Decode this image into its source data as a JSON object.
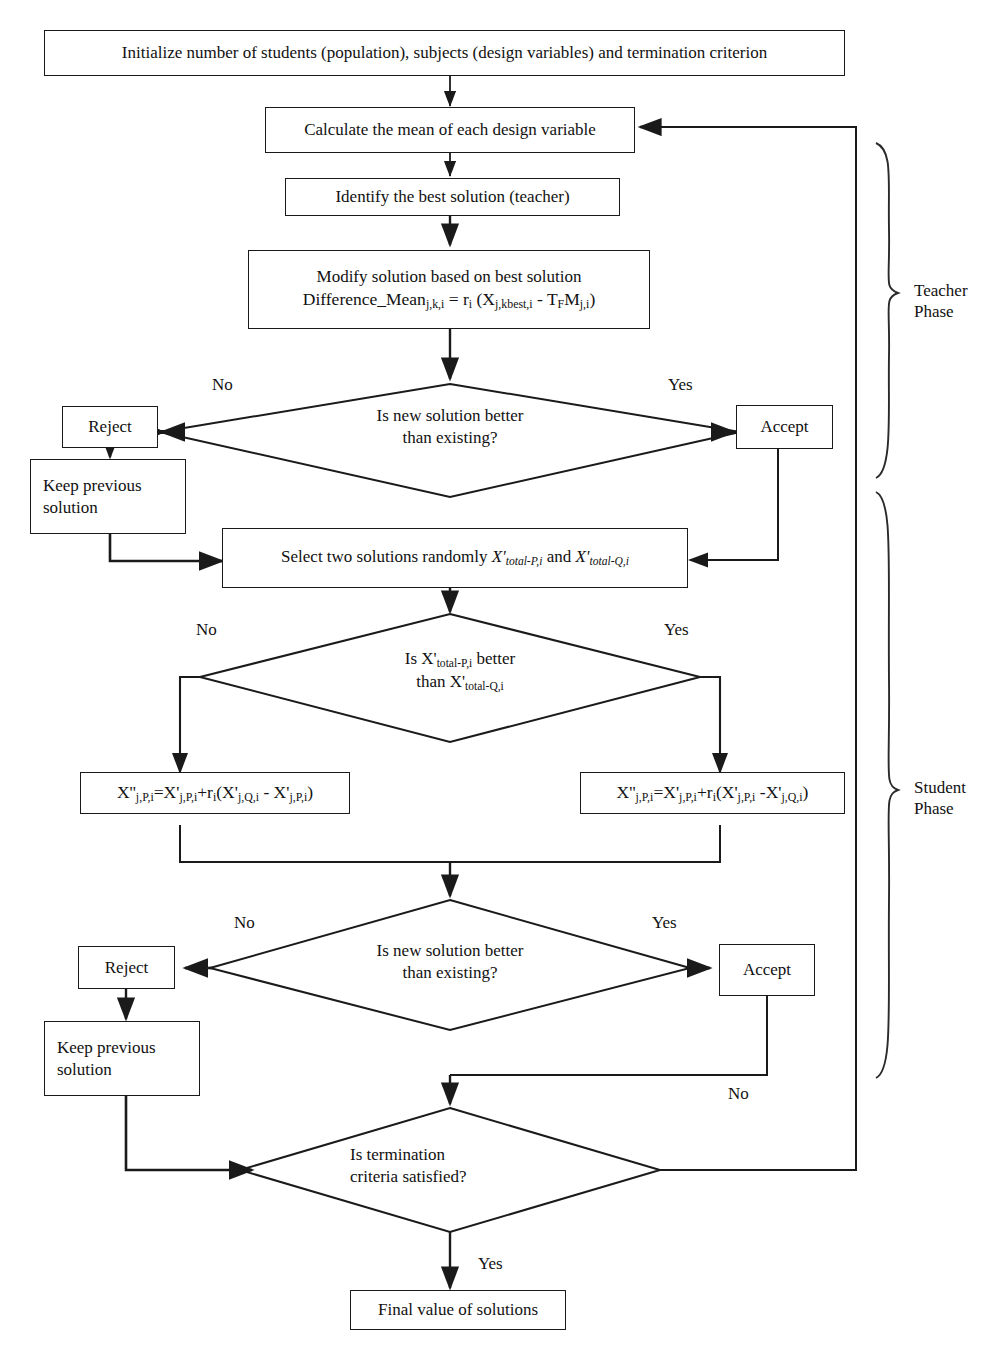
{
  "diagram": {
    "nodes": {
      "initialize": "Initialize number of students (population), subjects (design variables) and termination criterion",
      "calculate_mean": "Calculate the mean of each design variable",
      "identify_best": "Identify the best solution (teacher)",
      "modify_line1": "Modify solution based on best solution",
      "modify_line2": "Difference_Mean",
      "modify_line2_sub1": "j,k,i",
      "modify_line2_eq": " = r",
      "modify_line2_sub2": "i",
      "modify_line2_rest": " (X",
      "modify_line2_sub3": "j,kbest,i",
      "modify_line2_minus": " -  T",
      "modify_line2_sub4": "F",
      "modify_line2_m": "M",
      "modify_line2_sub5": "j,i",
      "modify_line2_close": ")",
      "decision_teacher_l1": "Is new solution better",
      "decision_teacher_l2": "than  existing?",
      "reject_teacher": "Reject",
      "accept_teacher": "Accept",
      "keep_prev_teacher_l1": "Keep previous",
      "keep_prev_teacher_l2": "solution",
      "select_two_pre": "Select two solutions randomly ",
      "select_two_x1": "X'",
      "select_two_x1_sub": "total-P,i",
      "select_two_and": " and ",
      "select_two_x2": "X'",
      "select_two_x2_sub": "total-Q,i",
      "decision_pq_l1_pre": "Is X'",
      "decision_pq_l1_sub": "total-P,i",
      "decision_pq_l1_post": " better",
      "decision_pq_l2_pre": "than X'",
      "decision_pq_l2_sub": "total-Q,i",
      "formula_left": "X''j,P,i=X'j,P,i+ri(X'j,Q,i - X'j,P,i)",
      "formula_right": "X''j,P,i=X'j,P,i+ri(X'j,P,i -X'j,Q,i)",
      "decision_student_l1": "Is new solution better",
      "decision_student_l2": "than  existing?",
      "reject_student": "Reject",
      "accept_student": "Accept",
      "keep_prev_student_l1": "Keep previous",
      "keep_prev_student_l2": "solution",
      "decision_term_l1": "Is termination",
      "decision_term_l2": "criteria satisfied?",
      "final_value": "Final value of solutions"
    },
    "edge_labels": {
      "teacher_no": "No",
      "teacher_yes": "Yes",
      "pq_no": "No",
      "pq_yes": "Yes",
      "student_no": "No",
      "student_yes": "Yes",
      "term_no": "No",
      "term_yes": "Yes"
    },
    "phases": {
      "teacher_l1": "Teacher",
      "teacher_l2": "Phase",
      "student_l1": "Student",
      "student_l2": "Phase"
    },
    "colors": {
      "stroke": "#1a1a1a",
      "background": "#ffffff",
      "text": "#111111"
    }
  }
}
